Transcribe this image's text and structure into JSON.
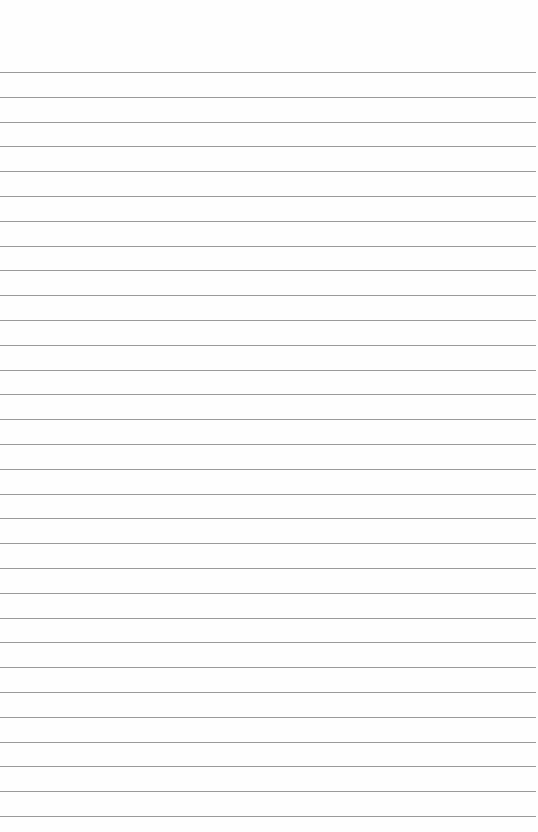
{
  "page": {
    "type": "blank lined paper",
    "background_color": "#fefefe",
    "line_color": "#9a9a9a",
    "first_line_y": 72,
    "line_spacing": 24.8,
    "line_count": 31
  }
}
